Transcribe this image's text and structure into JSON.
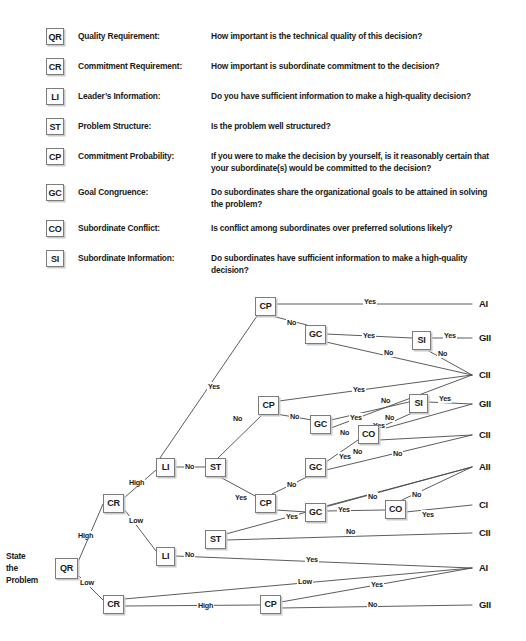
{
  "legend": {
    "rows": [
      {
        "code": "QR",
        "term": "Quality Requirement:",
        "desc": "How important is the technical quality of this decision?"
      },
      {
        "code": "CR",
        "term": "Commitment Requirement:",
        "desc": "How important is subordinate commitment to the decision?"
      },
      {
        "code": "LI",
        "term": "Leader’s Information:",
        "desc": "Do you have sufficient information to make a high-quality decision?"
      },
      {
        "code": "ST",
        "term": "Problem Structure:",
        "desc": "Is the problem well structured?"
      },
      {
        "code": "CP",
        "term": "Commitment Probability:",
        "desc": "If you were to make the decision by yourself, is it reasonably certain that your subordinate(s) would be committed to the decision?"
      },
      {
        "code": "GC",
        "term": "Goal Congruence:",
        "desc": "Do subordinates share the organizational goals to be attained in solving the problem?"
      },
      {
        "code": "CO",
        "term": "Subordinate Conflict:",
        "desc": "Is conflict among subordinates over preferred solutions likely?"
      },
      {
        "code": "SI",
        "term": "Subordinate Information:",
        "desc": "Do subordinates have sufficient information to make a high-quality decision?"
      }
    ]
  },
  "tree": {
    "start_label": "State\nthe\nProblem",
    "start_line1": "State",
    "start_line2": "the",
    "start_line3": "Problem",
    "nodes": [
      {
        "id": "n0",
        "code": "QR",
        "x": 55,
        "y": 558,
        "w": 23,
        "h": 21
      },
      {
        "id": "n1",
        "code": "CR",
        "x": 103,
        "y": 494,
        "w": 21,
        "h": 19
      },
      {
        "id": "n2",
        "code": "CR",
        "x": 103,
        "y": 595,
        "w": 21,
        "h": 19
      },
      {
        "id": "n3",
        "code": "LI",
        "x": 156,
        "y": 458,
        "w": 19,
        "h": 19
      },
      {
        "id": "n4",
        "code": "LI",
        "x": 156,
        "y": 547,
        "w": 19,
        "h": 19
      },
      {
        "id": "n5",
        "code": "ST",
        "x": 205,
        "y": 458,
        "w": 21,
        "h": 19
      },
      {
        "id": "n6",
        "code": "ST",
        "x": 205,
        "y": 530,
        "w": 21,
        "h": 19
      },
      {
        "id": "n7",
        "code": "CP",
        "x": 255,
        "y": 297,
        "w": 21,
        "h": 19
      },
      {
        "id": "n8",
        "code": "GC",
        "x": 305,
        "y": 325,
        "w": 21,
        "h": 19
      },
      {
        "id": "n9",
        "code": "SI",
        "x": 412,
        "y": 331,
        "w": 19,
        "h": 19
      },
      {
        "id": "n10",
        "code": "CP",
        "x": 258,
        "y": 396,
        "w": 21,
        "h": 19
      },
      {
        "id": "n11",
        "code": "GC",
        "x": 310,
        "y": 415,
        "w": 21,
        "h": 19
      },
      {
        "id": "n12",
        "code": "SI",
        "x": 409,
        "y": 394,
        "w": 19,
        "h": 19
      },
      {
        "id": "n13",
        "code": "CO",
        "x": 358,
        "y": 425,
        "w": 21,
        "h": 19
      },
      {
        "id": "n14",
        "code": "GC",
        "x": 305,
        "y": 458,
        "w": 21,
        "h": 19
      },
      {
        "id": "n15",
        "code": "CP",
        "x": 255,
        "y": 494,
        "w": 21,
        "h": 19
      },
      {
        "id": "n16",
        "code": "GC",
        "x": 305,
        "y": 503,
        "w": 21,
        "h": 19
      },
      {
        "id": "n17",
        "code": "CO",
        "x": 385,
        "y": 500,
        "w": 21,
        "h": 19
      },
      {
        "id": "n18",
        "code": "CP",
        "x": 260,
        "y": 595,
        "w": 21,
        "h": 19
      }
    ],
    "outcomes": [
      {
        "id": "o1",
        "label": "AI",
        "x": 479,
        "y": 298
      },
      {
        "id": "o2",
        "label": "GII",
        "x": 479,
        "y": 332
      },
      {
        "id": "o3",
        "label": "CII",
        "x": 479,
        "y": 369
      },
      {
        "id": "o4",
        "label": "GII",
        "x": 479,
        "y": 398
      },
      {
        "id": "o5",
        "label": "CII",
        "x": 479,
        "y": 429
      },
      {
        "id": "o6",
        "label": "AII",
        "x": 479,
        "y": 461
      },
      {
        "id": "o7",
        "label": "CI",
        "x": 479,
        "y": 499
      },
      {
        "id": "o8",
        "label": "CII",
        "x": 479,
        "y": 527
      },
      {
        "id": "o9",
        "label": "AI",
        "x": 479,
        "y": 562
      },
      {
        "id": "o10",
        "label": "GII",
        "x": 479,
        "y": 599
      }
    ],
    "edge_labels": [
      {
        "id": "el1",
        "text": "High",
        "x": 77,
        "y": 531
      },
      {
        "id": "el2",
        "text": "Low",
        "x": 79,
        "y": 578
      },
      {
        "id": "el3",
        "text": "High",
        "x": 128,
        "y": 478
      },
      {
        "id": "el4",
        "text": "Low",
        "x": 128,
        "y": 516
      },
      {
        "id": "el5",
        "text": "Yes",
        "x": 207,
        "y": 382
      },
      {
        "id": "el6",
        "text": "No",
        "x": 184,
        "y": 462
      },
      {
        "id": "el7",
        "text": "No",
        "x": 184,
        "y": 550
      },
      {
        "id": "el8",
        "text": "No",
        "x": 232,
        "y": 414
      },
      {
        "id": "el9",
        "text": "Yes",
        "x": 234,
        "y": 493
      },
      {
        "id": "el10",
        "text": "Yes",
        "x": 363,
        "y": 297
      },
      {
        "id": "el11",
        "text": "No",
        "x": 286,
        "y": 318
      },
      {
        "id": "el12",
        "text": "Yes",
        "x": 362,
        "y": 331
      },
      {
        "id": "el13",
        "text": "No",
        "x": 383,
        "y": 348
      },
      {
        "id": "el14",
        "text": "Yes",
        "x": 443,
        "y": 331
      },
      {
        "id": "el15",
        "text": "No",
        "x": 437,
        "y": 349
      },
      {
        "id": "el16",
        "text": "Yes",
        "x": 352,
        "y": 385
      },
      {
        "id": "el17",
        "text": "No",
        "x": 289,
        "y": 412
      },
      {
        "id": "el18",
        "text": "No",
        "x": 380,
        "y": 396
      },
      {
        "id": "el19",
        "text": "Yes",
        "x": 349,
        "y": 413
      },
      {
        "id": "el20",
        "text": "No",
        "x": 384,
        "y": 413
      },
      {
        "id": "el21",
        "text": "Yes",
        "x": 438,
        "y": 394
      },
      {
        "id": "el22",
        "text": "No",
        "x": 339,
        "y": 428
      },
      {
        "id": "el23",
        "text": "Yes",
        "x": 372,
        "y": 421
      },
      {
        "id": "el24",
        "text": "No",
        "x": 352,
        "y": 447
      },
      {
        "id": "el25",
        "text": "Yes",
        "x": 338,
        "y": 452
      },
      {
        "id": "el26",
        "text": "No",
        "x": 392,
        "y": 449
      },
      {
        "id": "el27",
        "text": "No",
        "x": 286,
        "y": 480
      },
      {
        "id": "el28",
        "text": "Yes",
        "x": 285,
        "y": 512
      },
      {
        "id": "el29",
        "text": "Yes",
        "x": 337,
        "y": 505
      },
      {
        "id": "el30",
        "text": "No",
        "x": 367,
        "y": 492
      },
      {
        "id": "el31",
        "text": "No",
        "x": 411,
        "y": 490
      },
      {
        "id": "el32",
        "text": "Yes",
        "x": 421,
        "y": 510
      },
      {
        "id": "el33",
        "text": "No",
        "x": 345,
        "y": 527
      },
      {
        "id": "el34",
        "text": "Yes",
        "x": 305,
        "y": 555
      },
      {
        "id": "el35",
        "text": "Low",
        "x": 297,
        "y": 577
      },
      {
        "id": "el36",
        "text": "High",
        "x": 197,
        "y": 601
      },
      {
        "id": "el37",
        "text": "Yes",
        "x": 370,
        "y": 580
      },
      {
        "id": "el38",
        "text": "No",
        "x": 367,
        "y": 600
      }
    ],
    "edges": [
      {
        "id": "e1",
        "from": "QR",
        "to": "CR-high",
        "d": "M 78 562 L 103 504"
      },
      {
        "id": "e2",
        "from": "QR",
        "to": "CR-low",
        "d": "M 78 575 L 103 600"
      },
      {
        "id": "e3",
        "from": "CR",
        "to": "LI-high",
        "d": "M 124 498 L 156 470"
      },
      {
        "id": "e4",
        "from": "CR",
        "to": "LI-low",
        "d": "M 124 509 L 156 551"
      },
      {
        "id": "e5",
        "from": "LI",
        "to": "CP-yes",
        "d": "M 160 458 L 257 316"
      },
      {
        "id": "e6",
        "from": "LI",
        "to": "ST-no",
        "d": "M 175 467 L 205 467"
      },
      {
        "id": "e7",
        "from": "ST",
        "to": "CP2-no",
        "d": "M 218 458 L 262 415"
      },
      {
        "id": "e8",
        "from": "ST",
        "to": "CP3-yes",
        "d": "M 220 477 L 257 497"
      },
      {
        "id": "e9",
        "from": "CP1",
        "to": "AI",
        "d": "M 276 304 L 472 304"
      },
      {
        "id": "e10",
        "from": "CP1",
        "to": "GC1-no",
        "d": "M 272 316 L 307 325"
      },
      {
        "id": "e11",
        "from": "GC1",
        "to": "SI1-yes",
        "d": "M 326 334 L 412 338"
      },
      {
        "id": "e12",
        "from": "GC1",
        "to": "CII-no",
        "d": "M 326 342 L 472 375"
      },
      {
        "id": "e13",
        "from": "SI1",
        "to": "GII",
        "d": "M 431 338 L 472 338"
      },
      {
        "id": "e14",
        "from": "SI1",
        "to": "CII",
        "d": "M 427 350 L 472 375"
      },
      {
        "id": "e15",
        "from": "CP2",
        "to": "CII-yes",
        "d": "M 279 401 L 472 375"
      },
      {
        "id": "e16",
        "from": "CP2",
        "to": "GC2-no",
        "d": "M 276 414 L 312 420"
      },
      {
        "id": "e17",
        "from": "GC2",
        "to": "SI2-yes",
        "d": "M 331 420 L 409 402"
      },
      {
        "id": "e18",
        "from": "GC2",
        "to": "CII-no",
        "d": "M 331 428 L 472 375"
      },
      {
        "id": "e19",
        "from": "SI2",
        "to": "GII",
        "d": "M 428 402 L 472 404"
      },
      {
        "id": "e20",
        "from": "SI2",
        "to": "CO1-no",
        "d": "M 412 413 L 379 428"
      },
      {
        "id": "e21",
        "from": "CO1",
        "to": "GII-yes",
        "d": "M 379 430 L 472 404"
      },
      {
        "id": "e22",
        "from": "CO1",
        "to": "CII-no",
        "d": "M 379 440 L 472 435"
      },
      {
        "id": "e23",
        "from": "GC3",
        "to": "CO1-yes",
        "d": "M 326 462 L 358 440"
      },
      {
        "id": "e24",
        "from": "GC3",
        "to": "CII-no",
        "d": "M 326 470 L 472 435"
      },
      {
        "id": "e25",
        "from": "CP3",
        "to": "GC3-no",
        "d": "M 272 494 L 307 477"
      },
      {
        "id": "e26",
        "from": "CP3",
        "to": "GC4-yes",
        "d": "M 276 510 L 307 512"
      },
      {
        "id": "e27",
        "from": "GC4",
        "to": "CO2-yes",
        "d": "M 326 511 L 385 510"
      },
      {
        "id": "e28",
        "from": "GC4",
        "to": "AII-no",
        "d": "M 326 506 L 472 467"
      },
      {
        "id": "e29",
        "from": "CO2",
        "to": "AII-no",
        "d": "M 402 500 L 472 467"
      },
      {
        "id": "e30",
        "from": "CO2",
        "to": "CI-yes",
        "d": "M 406 512 L 472 505"
      },
      {
        "id": "e31",
        "from": "ST2",
        "to": "AII",
        "d": "M 226 534 L 472 467"
      },
      {
        "id": "e32",
        "from": "ST2",
        "to": "CII-no",
        "d": "M 226 540 L 472 533"
      },
      {
        "id": "e33",
        "from": "LI2",
        "to": "AI-yes",
        "d": "M 175 556 L 472 568"
      },
      {
        "id": "e34",
        "from": "CR2",
        "to": "AI-low",
        "d": "M 124 599 L 472 568"
      },
      {
        "id": "e35",
        "from": "CR2",
        "to": "CP4-high",
        "d": "M 124 606 L 260 605"
      },
      {
        "id": "e36",
        "from": "CP4",
        "to": "AI-yes",
        "d": "M 281 602 L 472 568"
      },
      {
        "id": "e37",
        "from": "CP4",
        "to": "GII-no",
        "d": "M 281 608 L 472 605"
      }
    ]
  },
  "colors": {
    "line": "#4a4a4a",
    "box_border": "#7c7c7c",
    "box_shadow": "#c9c9c9",
    "text": "#1a1a1a",
    "background": "#ffffff"
  }
}
